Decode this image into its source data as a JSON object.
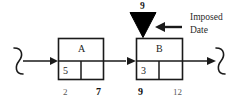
{
  "diagram": {
    "type": "precedence-network-fragment",
    "nodes": [
      {
        "id": "A",
        "title": "A",
        "duration_cell": "5",
        "second_cell": "",
        "early_date_label": "2",
        "late_date_label": "7"
      },
      {
        "id": "B",
        "title": "B",
        "duration_cell": "3",
        "second_cell": "",
        "early_date_label": "9",
        "late_date_label": "12"
      }
    ],
    "milestone": {
      "icon": "down-triangle-milestone-icon",
      "value": "9"
    },
    "annotation": {
      "line1": "Imposed",
      "line2": "Date",
      "arrow": "left-arrow-icon"
    },
    "connectors": {
      "left_break": "squiggle-break-icon",
      "right_break": "squiggle-break-icon",
      "a_to_b": "right-arrow-icon",
      "into_a": "right-arrow-icon",
      "out_of_b": "right-arrow-icon"
    },
    "colors": {
      "stroke": "#1a1a1a",
      "fill": "#ffffff",
      "milestone_fill": "#000000",
      "background": "#ffffff",
      "date_bold": "#111111",
      "date_light": "#5a5a5a"
    }
  }
}
